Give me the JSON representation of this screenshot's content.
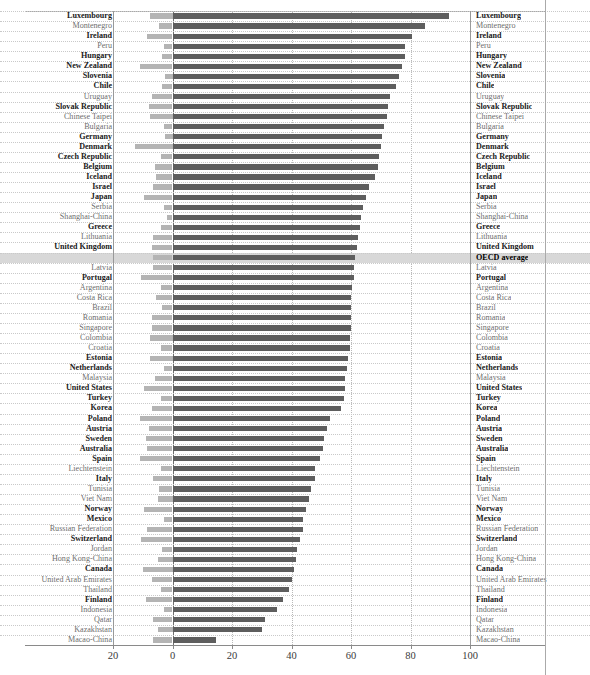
{
  "chart_data": {
    "type": "bar",
    "orientation": "horizontal",
    "title": "",
    "xlabel": "",
    "ylabel": "",
    "xlim": [
      -20,
      100
    ],
    "xticks": [
      -20,
      0,
      20,
      40,
      60,
      80,
      100
    ],
    "xticklabels": [
      "20",
      "0",
      "20",
      "40",
      "60",
      "80",
      "100"
    ],
    "grid": true,
    "legend": [],
    "series": [
      {
        "name": "positive",
        "color": "#5e5e5e"
      },
      {
        "name": "negative",
        "color": "#b4b4b4"
      }
    ],
    "categories": [
      "Luxembourg",
      "Montenegro",
      "Ireland",
      "Peru",
      "Hungary",
      "New Zealand",
      "Slovenia",
      "Chile",
      "Uruguay",
      "Slovak Republic",
      "Chinese Taipei",
      "Bulgaria",
      "Germany",
      "Denmark",
      "Czech Republic",
      "Belgium",
      "Iceland",
      "Israel",
      "Japan",
      "Serbia",
      "Shanghai-China",
      "Greece",
      "Lithuania",
      "United Kingdom",
      "OECD average",
      "Latvia",
      "Portugal",
      "Argentina",
      "Costa Rica",
      "Brazil",
      "Romania",
      "Singapore",
      "Colombia",
      "Croatia",
      "Estonia",
      "Netherlands",
      "Malaysia",
      "United States",
      "Turkey",
      "Korea",
      "Poland",
      "Austria",
      "Sweden",
      "Australia",
      "Spain",
      "Liechtenstein",
      "Italy",
      "Tunisia",
      "Viet Nam",
      "Norway",
      "Mexico",
      "Russian Federation",
      "Switzerland",
      "Jordan",
      "Hong Kong-China",
      "Canada",
      "United Arab Emirates",
      "Thailand",
      "Finland",
      "Indonesia",
      "Qatar",
      "Kazakhstan",
      "Macao-China"
    ],
    "rows": [
      {
        "name": "Luxembourg",
        "group": "oecd",
        "pos": 93.0,
        "neg": -7.5
      },
      {
        "name": "Montenegro",
        "group": "partner",
        "pos": 85.0,
        "neg": -4.5
      },
      {
        "name": "Ireland",
        "group": "oecd",
        "pos": 80.5,
        "neg": -8.5
      },
      {
        "name": "Peru",
        "group": "partner",
        "pos": 78.0,
        "neg": -3.0
      },
      {
        "name": "Hungary",
        "group": "oecd",
        "pos": 78.0,
        "neg": -3.5
      },
      {
        "name": "New Zealand",
        "group": "oecd",
        "pos": 77.0,
        "neg": -11.0
      },
      {
        "name": "Slovenia",
        "group": "oecd",
        "pos": 76.0,
        "neg": -2.5
      },
      {
        "name": "Chile",
        "group": "oecd",
        "pos": 75.0,
        "neg": -3.5
      },
      {
        "name": "Uruguay",
        "group": "partner",
        "pos": 73.0,
        "neg": -7.0
      },
      {
        "name": "Slovak Republic",
        "group": "oecd",
        "pos": 72.5,
        "neg": -8.0
      },
      {
        "name": "Chinese Taipei",
        "group": "partner",
        "pos": 72.0,
        "neg": -7.5
      },
      {
        "name": "Bulgaria",
        "group": "partner",
        "pos": 71.0,
        "neg": -3.0
      },
      {
        "name": "Germany",
        "group": "oecd",
        "pos": 70.5,
        "neg": -2.5
      },
      {
        "name": "Denmark",
        "group": "oecd",
        "pos": 70.0,
        "neg": -12.5
      },
      {
        "name": "Czech Republic",
        "group": "oecd",
        "pos": 69.5,
        "neg": -4.0
      },
      {
        "name": "Belgium",
        "group": "oecd",
        "pos": 69.0,
        "neg": -6.0
      },
      {
        "name": "Iceland",
        "group": "oecd",
        "pos": 68.0,
        "neg": -5.5
      },
      {
        "name": "Israel",
        "group": "oecd",
        "pos": 66.0,
        "neg": -6.5
      },
      {
        "name": "Japan",
        "group": "oecd",
        "pos": 65.0,
        "neg": -9.5
      },
      {
        "name": "Serbia",
        "group": "partner",
        "pos": 64.0,
        "neg": -3.0
      },
      {
        "name": "Shanghai-China",
        "group": "partner",
        "pos": 63.5,
        "neg": -2.0
      },
      {
        "name": "Greece",
        "group": "oecd",
        "pos": 63.0,
        "neg": -4.0
      },
      {
        "name": "Lithuania",
        "group": "partner",
        "pos": 62.5,
        "neg": -6.5
      },
      {
        "name": "United Kingdom",
        "group": "oecd",
        "pos": 62.0,
        "neg": -7.0
      },
      {
        "name": "OECD average",
        "group": "average",
        "pos": 61.5,
        "neg": -6.5
      },
      {
        "name": "Latvia",
        "group": "partner",
        "pos": 61.0,
        "neg": -6.5
      },
      {
        "name": "Portugal",
        "group": "oecd",
        "pos": 61.0,
        "neg": -10.5
      },
      {
        "name": "Argentina",
        "group": "partner",
        "pos": 60.5,
        "neg": -4.0
      },
      {
        "name": "Costa Rica",
        "group": "partner",
        "pos": 60.0,
        "neg": -5.5
      },
      {
        "name": "Brazil",
        "group": "partner",
        "pos": 60.0,
        "neg": -3.5
      },
      {
        "name": "Romania",
        "group": "partner",
        "pos": 60.0,
        "neg": -7.0
      },
      {
        "name": "Singapore",
        "group": "partner",
        "pos": 60.0,
        "neg": -7.0
      },
      {
        "name": "Colombia",
        "group": "partner",
        "pos": 59.5,
        "neg": -7.5
      },
      {
        "name": "Croatia",
        "group": "partner",
        "pos": 59.5,
        "neg": -4.0
      },
      {
        "name": "Estonia",
        "group": "oecd",
        "pos": 59.0,
        "neg": -7.5
      },
      {
        "name": "Netherlands",
        "group": "oecd",
        "pos": 58.5,
        "neg": -3.0
      },
      {
        "name": "Malaysia",
        "group": "partner",
        "pos": 58.0,
        "neg": -6.0
      },
      {
        "name": "United States",
        "group": "oecd",
        "pos": 58.0,
        "neg": -9.5
      },
      {
        "name": "Turkey",
        "group": "oecd",
        "pos": 57.5,
        "neg": -4.0
      },
      {
        "name": "Korea",
        "group": "oecd",
        "pos": 56.5,
        "neg": -7.0
      },
      {
        "name": "Poland",
        "group": "oecd",
        "pos": 53.0,
        "neg": -11.0
      },
      {
        "name": "Austria",
        "group": "oecd",
        "pos": 52.0,
        "neg": -8.0
      },
      {
        "name": "Sweden",
        "group": "oecd",
        "pos": 51.0,
        "neg": -9.0
      },
      {
        "name": "Australia",
        "group": "oecd",
        "pos": 50.5,
        "neg": -8.5
      },
      {
        "name": "Spain",
        "group": "oecd",
        "pos": 49.5,
        "neg": -11.0
      },
      {
        "name": "Liechtenstein",
        "group": "partner",
        "pos": 48.0,
        "neg": -4.0
      },
      {
        "name": "Italy",
        "group": "oecd",
        "pos": 48.0,
        "neg": -6.5
      },
      {
        "name": "Tunisia",
        "group": "partner",
        "pos": 46.5,
        "neg": -4.5
      },
      {
        "name": "Viet Nam",
        "group": "partner",
        "pos": 46.0,
        "neg": -5.0
      },
      {
        "name": "Norway",
        "group": "oecd",
        "pos": 45.0,
        "neg": -9.5
      },
      {
        "name": "Mexico",
        "group": "oecd",
        "pos": 44.0,
        "neg": -3.0
      },
      {
        "name": "Russian Federation",
        "group": "partner",
        "pos": 44.0,
        "neg": -8.5
      },
      {
        "name": "Switzerland",
        "group": "oecd",
        "pos": 43.0,
        "neg": -10.5
      },
      {
        "name": "Jordan",
        "group": "partner",
        "pos": 42.0,
        "neg": -3.5
      },
      {
        "name": "Hong Kong-China",
        "group": "partner",
        "pos": 41.5,
        "neg": -5.0
      },
      {
        "name": "Canada",
        "group": "oecd",
        "pos": 41.0,
        "neg": -10.0
      },
      {
        "name": "United Arab Emirates",
        "group": "partner",
        "pos": 40.0,
        "neg": -7.0
      },
      {
        "name": "Thailand",
        "group": "partner",
        "pos": 39.0,
        "neg": -4.0
      },
      {
        "name": "Finland",
        "group": "oecd",
        "pos": 37.0,
        "neg": -9.0
      },
      {
        "name": "Indonesia",
        "group": "partner",
        "pos": 35.0,
        "neg": -3.0
      },
      {
        "name": "Qatar",
        "group": "partner",
        "pos": 31.0,
        "neg": -6.5
      },
      {
        "name": "Kazakhstan",
        "group": "partner",
        "pos": 30.0,
        "neg": -5.0
      },
      {
        "name": "Macao-China",
        "group": "partner",
        "pos": 14.5,
        "neg": -6.5
      }
    ]
  },
  "colors": {
    "positive_bar": "#5e5e5e",
    "negative_bar": "#b4b4b4",
    "highlight_row": "#d8d8d8",
    "oecd_label": "#1a1a1a",
    "partner_label": "#6e6e6e",
    "zero_line": "#707070",
    "grid_line": "#bdbdbd"
  }
}
